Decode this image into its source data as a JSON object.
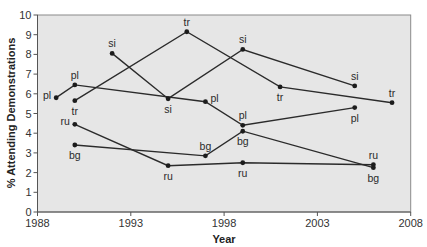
{
  "chart_data": {
    "type": "line",
    "title": "",
    "xlabel": "Year",
    "ylabel": "% Attending Demonstrations",
    "xlim": [
      1988,
      2008
    ],
    "ylim": [
      0,
      10
    ],
    "x_ticks": [
      1988,
      1993,
      1998,
      2003,
      2008
    ],
    "y_ticks": [
      0,
      1,
      2,
      3,
      4,
      5,
      6,
      7,
      8,
      9,
      10
    ],
    "grid": false,
    "legend": "none (series labeled inline at each point)",
    "plot_background": "#e6e6e6",
    "line_color": "#2b2b2b",
    "series": [
      {
        "name": "pl",
        "x": [
          1989,
          1990,
          1997,
          1999,
          2005
        ],
        "y": [
          5.8,
          6.45,
          5.6,
          4.4,
          5.3
        ],
        "label_positions": [
          "left",
          "above",
          "right",
          "above",
          "below"
        ]
      },
      {
        "name": "tr",
        "x": [
          1990,
          1996,
          2001,
          2007
        ],
        "y": [
          5.65,
          9.15,
          6.35,
          5.55
        ],
        "label_positions": [
          "below",
          "above",
          "below",
          "above"
        ]
      },
      {
        "name": "si",
        "x": [
          1992,
          1995,
          1999,
          2005
        ],
        "y": [
          8.05,
          5.75,
          8.25,
          6.4
        ],
        "label_positions": [
          "above",
          "below",
          "above",
          "above"
        ]
      },
      {
        "name": "ru",
        "x": [
          1990,
          1995,
          1999,
          2006
        ],
        "y": [
          4.45,
          2.35,
          2.5,
          2.4
        ],
        "label_positions": [
          "left",
          "below",
          "below",
          "above"
        ]
      },
      {
        "name": "bg",
        "x": [
          1990,
          1997,
          1999,
          2006
        ],
        "y": [
          3.4,
          2.85,
          4.1,
          2.25
        ],
        "label_positions": [
          "below",
          "above",
          "below",
          "below"
        ]
      }
    ]
  },
  "axes": {
    "x_title": "Year",
    "y_title": "% Attending Demonstrations"
  }
}
